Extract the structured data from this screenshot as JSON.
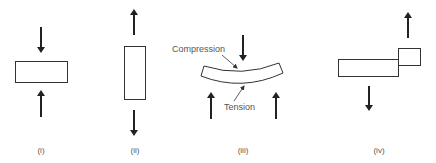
{
  "figure": {
    "panels": [
      {
        "id": "i",
        "caption": "(i)",
        "description": "compression - arrows pushing toward horizontal block"
      },
      {
        "id": "ii",
        "caption": "(ii)",
        "description": "tension - arrows pulling away from vertical block"
      },
      {
        "id": "iii",
        "caption": "(iii)",
        "description": "bending - curved beam",
        "labels": {
          "top": "Compression",
          "bottom": "Tension"
        }
      },
      {
        "id": "iv",
        "caption": "(iv)",
        "description": "shear - offset blocks with opposing arrows"
      }
    ]
  },
  "colors": {
    "stroke": "#333333",
    "arrow": "#222222",
    "text": "#555555"
  }
}
